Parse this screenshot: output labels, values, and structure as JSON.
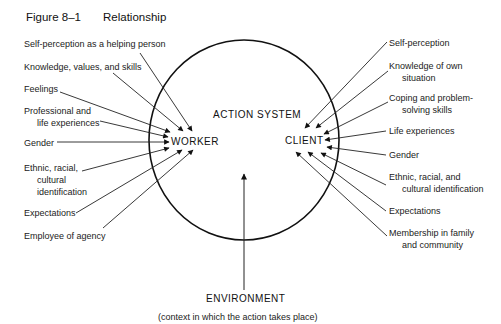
{
  "figure": {
    "number": "Figure 8–1",
    "title": "Relationship"
  },
  "diagram": {
    "system_label": "ACTION SYSTEM",
    "worker_label": "WORKER",
    "client_label": "CLIENT",
    "environment_label": "ENVIRONMENT",
    "environment_caption": "(context in which the action takes place)",
    "worker_inputs": [
      {
        "line1": "Self-perception as a helping person"
      },
      {
        "line1": "Knowledge, values, and skills"
      },
      {
        "line1": "Feelings"
      },
      {
        "line1": "Professional and",
        "line2": "life experiences"
      },
      {
        "line1": "Gender"
      },
      {
        "line1": "Ethnic, racial,",
        "line2": "cultural",
        "line3": "identification"
      },
      {
        "line1": "Expectations"
      },
      {
        "line1": "Employee of agency"
      }
    ],
    "client_inputs": [
      {
        "line1": "Self-perception"
      },
      {
        "line1": "Knowledge of own",
        "line2": "situation"
      },
      {
        "line1": "Coping and problem-",
        "line2": "solving skills"
      },
      {
        "line1": "Life experiences"
      },
      {
        "line1": "Gender"
      },
      {
        "line1": "Ethnic, racial, and",
        "line2": "cultural identification"
      },
      {
        "line1": "Expectations"
      },
      {
        "line1": "Membership in family",
        "line2": "and community"
      }
    ],
    "colors": {
      "ink": "#111111",
      "background": "#ffffff"
    }
  }
}
